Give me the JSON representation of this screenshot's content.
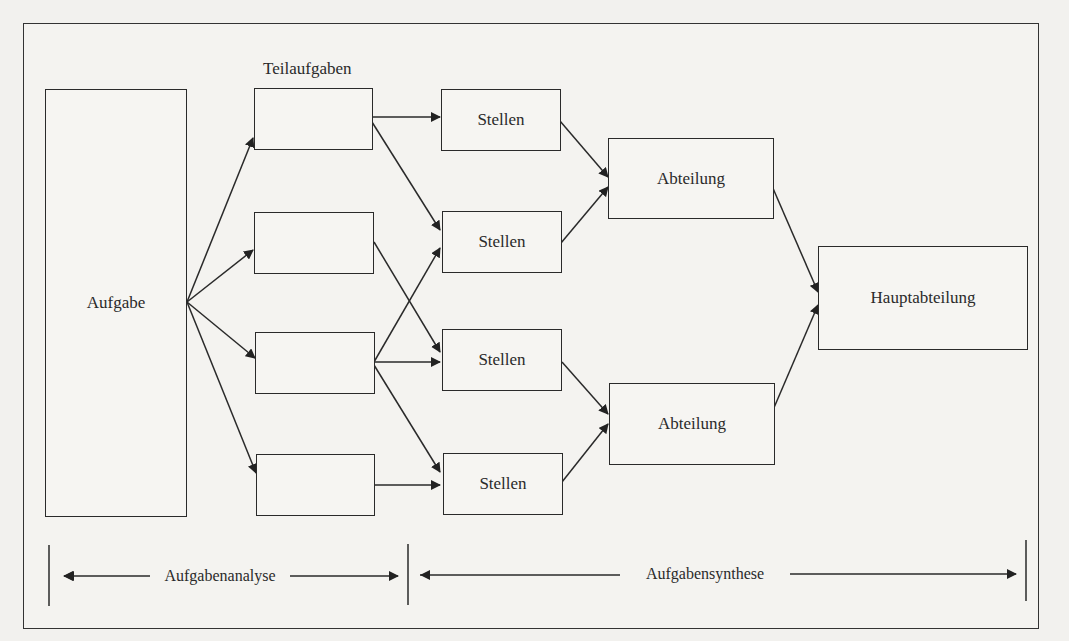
{
  "diagram": {
    "root": {
      "label": "Aufgabe"
    },
    "subtasks_heading": "Teilaufgaben",
    "subtasks": [
      {
        "label": ""
      },
      {
        "label": ""
      },
      {
        "label": ""
      },
      {
        "label": ""
      }
    ],
    "positions": [
      {
        "label": "Stellen"
      },
      {
        "label": "Stellen"
      },
      {
        "label": "Stellen"
      },
      {
        "label": "Stellen"
      }
    ],
    "departments": [
      {
        "label": "Abteilung"
      },
      {
        "label": "Abteilung"
      }
    ],
    "main_department": {
      "label": "Hauptabteilung"
    },
    "phases": {
      "analysis": "Aufgabenanalyse",
      "synthesis": "Aufgabensynthese"
    },
    "colors": {
      "line": "#2a2a2a",
      "background": "#f4f3f0"
    }
  }
}
